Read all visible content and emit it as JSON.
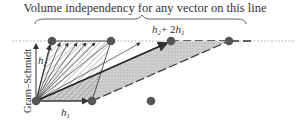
{
  "diagram": {
    "title": "Volume independency for any vector on this line",
    "labels": {
      "sum_vector": "h₂ + 2h₁",
      "h1": "h",
      "h1_sub": "1",
      "h2": "h",
      "h2_sub": "2",
      "process": "Gram–Schmidt",
      "sum_h2": "h",
      "sum_h2_sub": "2",
      "sum_plus": "+ 2",
      "sum_h1": "h",
      "sum_h1_sub": "1"
    },
    "colors": {
      "dot": "#555555",
      "line": "#333333",
      "shade": "#c8c8c8",
      "hatch": "#666666"
    },
    "line_points_x": [
      52,
      111,
      171,
      229
    ],
    "bottom_points": [
      [
        36,
        101
      ],
      [
        92,
        101
      ],
      [
        151,
        101
      ]
    ]
  }
}
